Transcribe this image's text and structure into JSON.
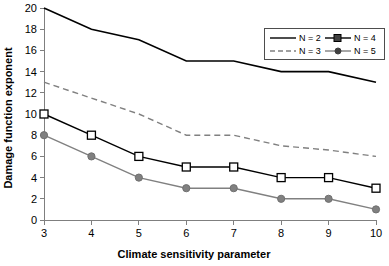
{
  "chart_data": {
    "type": "line",
    "title": "",
    "xlabel": "Climate sensitivity parameter",
    "ylabel": "Damage function exponent",
    "x": [
      3,
      4,
      5,
      6,
      7,
      8,
      9,
      10
    ],
    "xlim": [
      3,
      10
    ],
    "ylim": [
      0,
      20
    ],
    "xticks": [
      "3",
      "4",
      "5",
      "6",
      "7",
      "8",
      "9",
      "10"
    ],
    "yticks": [
      "0",
      "2",
      "4",
      "6",
      "8",
      "10",
      "12",
      "14",
      "16",
      "18",
      "20"
    ],
    "grid": false,
    "legend_position": "top-right",
    "series": [
      {
        "name": "N = 2",
        "values": [
          20,
          18,
          17,
          15,
          15,
          14,
          14,
          13
        ],
        "color": "#000000",
        "style": "solid",
        "marker": "none"
      },
      {
        "name": "N = 3",
        "values": [
          13,
          11.5,
          10,
          8,
          8,
          7,
          6.6,
          6
        ],
        "color": "#808080",
        "style": "dashed",
        "marker": "none"
      },
      {
        "name": "N = 4",
        "values": [
          10,
          8,
          6,
          5,
          5,
          4,
          4,
          3
        ],
        "color": "#000000",
        "style": "solid",
        "marker": "square-open"
      },
      {
        "name": "N = 5",
        "values": [
          8,
          6,
          4,
          3,
          3,
          2,
          2,
          1
        ],
        "color": "#808080",
        "style": "solid",
        "marker": "circle-filled"
      }
    ]
  },
  "legend": {
    "entries": [
      {
        "label": "N = 2"
      },
      {
        "label": "N = 4"
      },
      {
        "label": "N = 3"
      },
      {
        "label": "N = 5"
      }
    ]
  }
}
